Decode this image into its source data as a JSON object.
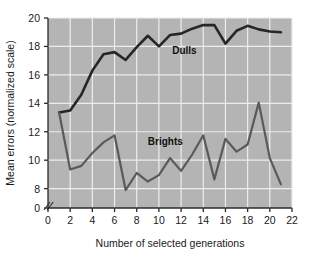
{
  "chart_data": {
    "type": "line",
    "title": "",
    "xlabel": "Number of selected generations",
    "ylabel": "Mean errors (normalized scale)",
    "xlim": [
      0,
      22
    ],
    "ylim": [
      7.2,
      20
    ],
    "y_axis_break": true,
    "y_break_base": 0,
    "grid": true,
    "legend": "inline-annotations",
    "xticks": [
      0,
      2,
      4,
      6,
      8,
      10,
      12,
      14,
      16,
      18,
      20,
      22
    ],
    "xtick_labels": [
      "0",
      "2",
      "4",
      "6",
      "8",
      "10",
      "12",
      "14",
      "16",
      "18",
      "20",
      "22"
    ],
    "yticks": [
      0,
      8,
      10,
      12,
      14,
      16,
      18,
      20
    ],
    "ytick_labels": [
      "0",
      "8",
      "10",
      "12",
      "14",
      "16",
      "18",
      "20"
    ],
    "x": [
      1,
      2,
      3,
      4,
      5,
      6,
      7,
      8,
      9,
      10,
      11,
      12,
      13,
      14,
      15,
      16,
      17,
      18,
      19,
      20,
      21
    ],
    "series": [
      {
        "name": "Dulls",
        "label": "Dulls",
        "label_x": 11.2,
        "label_y": 17.45,
        "color": "#262626",
        "line_width": 2.6,
        "values": [
          13.35,
          13.5,
          14.6,
          16.3,
          17.45,
          17.6,
          17.05,
          17.95,
          18.75,
          18.0,
          18.8,
          18.9,
          19.25,
          19.5,
          19.5,
          18.2,
          19.1,
          19.45,
          19.2,
          19.05,
          19.0
        ]
      },
      {
        "name": "Brights",
        "label": "Brights",
        "label_x": 9.0,
        "label_y": 11.05,
        "color": "#5a5a5a",
        "line_width": 2.2,
        "values": [
          13.35,
          9.35,
          9.6,
          10.5,
          11.25,
          11.75,
          7.9,
          9.1,
          8.5,
          8.95,
          10.15,
          9.25,
          10.4,
          11.75,
          8.65,
          11.5,
          10.6,
          11.1,
          14.05,
          10.15,
          8.3
        ]
      }
    ]
  },
  "axes": {
    "y_label": "Mean errors (normalized scale)",
    "x_label": "Number of selected generations"
  },
  "colors": {
    "plot_background": "#b4b4b4",
    "page_background": "#ffffff",
    "grid": "#ededed",
    "axis": "#2b2b2b",
    "dulls": "#262626",
    "brights": "#5a5a5a"
  }
}
